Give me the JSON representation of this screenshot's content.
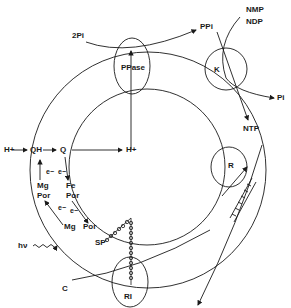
{
  "diagram": {
    "type": "biochemical pathway schematic",
    "colors": {
      "line": "#1a1a1a",
      "background": "#ffffff"
    },
    "enzymes": {
      "ppase": "PPase",
      "kinase": "K",
      "reductase": "R",
      "reaction_center": "RI"
    },
    "labels": {
      "two_pi": "2Pi",
      "ppi": "PPi",
      "nmp": "NMP",
      "ndp": "NDP",
      "pi": "Pi",
      "ntp": "NTP",
      "h_plus_out": "H+",
      "qh": "QH",
      "q": "Q",
      "h_plus_in": "H+",
      "e1": "e−",
      "e2": "e−",
      "e3": "e−",
      "e4": "e−",
      "mg_por_top_1": "Mg",
      "mg_por_top_2": "Por",
      "fe_por_1": "Fe",
      "fe_por_2": "Por",
      "mg_bottom": "Mg",
      "por_bottom": "Por",
      "hv": "hν",
      "sp": "SP",
      "c": "C"
    }
  }
}
